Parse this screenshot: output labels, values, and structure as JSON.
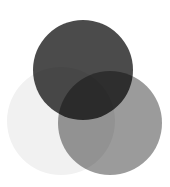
{
  "figure": {
    "type": "venn-diagram",
    "title": "",
    "width": 170,
    "height": 187,
    "background_color": "#ffffff",
    "blend_mode": "multiply",
    "set_count": 3
  },
  "chart_data": {
    "type": "venn",
    "title": "",
    "subtitle": "",
    "xlabel": "",
    "ylabel": "",
    "legend_position": "none",
    "grid": false,
    "sets": [
      {
        "id": "set-top",
        "label": "",
        "color": "#4b4b4b",
        "opacity": 1,
        "center_x": 83,
        "center_y": 70,
        "radius": 50
      },
      {
        "id": "set-left",
        "label": "",
        "color": "#f1f1f1",
        "opacity": 1,
        "center_x": 61,
        "center_y": 121,
        "radius": 54
      },
      {
        "id": "set-right",
        "label": "",
        "color": "#9b9b9b",
        "opacity": 1,
        "center_x": 110,
        "center_y": 123,
        "radius": 52
      }
    ],
    "region_colors": {
      "top_only": "#4b4b4b",
      "left_only": "#f1f1f1",
      "right_only": "#9b9b9b",
      "top_and_left": "#474747",
      "top_and_right": "#1d1d1d",
      "left_and_right": "#939393",
      "all_three": "#3b3b3b"
    }
  }
}
